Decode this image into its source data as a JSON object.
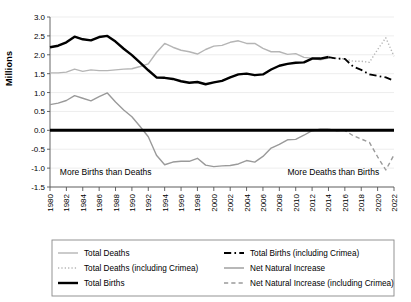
{
  "chart_data": {
    "type": "line",
    "title": "",
    "xlabel": "",
    "ylabel": "Millions",
    "xlim": [
      1980,
      2022
    ],
    "ylim": [
      -1.5,
      3.0
    ],
    "ytick_step": 0.5,
    "xtick_step": 2,
    "grid": true,
    "legend_position": "bottom",
    "yticks": [
      "3.0",
      "2.5",
      "2.0",
      "1.5",
      "1.0",
      "0.5",
      "0.0",
      "-0.5",
      "-1.0",
      "-1.5"
    ],
    "xticks": [
      "1980",
      "1982",
      "1984",
      "1986",
      "1988",
      "1990",
      "1992",
      "1994",
      "1996",
      "1998",
      "2000",
      "2002",
      "2004",
      "2006",
      "2008",
      "2010",
      "2012",
      "2014",
      "2016",
      "2018",
      "2020",
      "2022"
    ],
    "annotations": [
      {
        "text": "More Births than Deaths",
        "x": 1981.2,
        "y": -1.18,
        "align": "left"
      },
      {
        "text": "More Deaths than Births",
        "x": 2009.0,
        "y": -1.18,
        "align": "left"
      }
    ],
    "zero_line": 0.0,
    "series": [
      {
        "name": "Total Deaths",
        "color": "#b5b5b5",
        "style": "solid",
        "width": 1.4,
        "x": [
          1980,
          1981,
          1982,
          1983,
          1984,
          1985,
          1986,
          1987,
          1988,
          1989,
          1990,
          1991,
          1992,
          1993,
          1994,
          1995,
          1996,
          1997,
          1998,
          1999,
          2000,
          2001,
          2002,
          2003,
          2004,
          2005,
          2006,
          2007,
          2008,
          2009,
          2010,
          2011,
          2012,
          2013,
          2014
        ],
        "values": [
          1.52,
          1.52,
          1.54,
          1.62,
          1.56,
          1.6,
          1.58,
          1.58,
          1.6,
          1.62,
          1.63,
          1.69,
          1.76,
          2.06,
          2.3,
          2.2,
          2.12,
          2.08,
          2.02,
          2.14,
          2.23,
          2.25,
          2.33,
          2.37,
          2.3,
          2.3,
          2.17,
          2.08,
          2.08,
          2.01,
          2.03,
          1.93,
          1.91,
          1.87,
          1.91
        ]
      },
      {
        "name": "Total Deaths (including Crimea)",
        "color": "#b5b5b5",
        "style": "dotted",
        "width": 1.4,
        "x": [
          2014,
          2015,
          2016,
          2017,
          2018,
          2019,
          2020,
          2021,
          2022
        ],
        "values": [
          1.91,
          1.91,
          1.89,
          1.83,
          1.83,
          1.8,
          2.14,
          2.45,
          1.96
        ]
      },
      {
        "name": "Total Births",
        "color": "#000000",
        "style": "solid",
        "width": 2.4,
        "x": [
          1980,
          1981,
          1982,
          1983,
          1984,
          1985,
          1986,
          1987,
          1988,
          1989,
          1990,
          1991,
          1992,
          1993,
          1994,
          1995,
          1996,
          1997,
          1998,
          1999,
          2000,
          2001,
          2002,
          2003,
          2004,
          2005,
          2006,
          2007,
          2008,
          2009,
          2010,
          2011,
          2012,
          2013,
          2014
        ],
        "values": [
          2.2,
          2.24,
          2.33,
          2.48,
          2.41,
          2.38,
          2.47,
          2.5,
          2.35,
          2.16,
          1.99,
          1.79,
          1.59,
          1.4,
          1.39,
          1.36,
          1.3,
          1.26,
          1.28,
          1.22,
          1.27,
          1.31,
          1.4,
          1.48,
          1.5,
          1.46,
          1.48,
          1.61,
          1.71,
          1.76,
          1.79,
          1.8,
          1.9,
          1.9,
          1.94
        ]
      },
      {
        "name": "Total Births (including Crimea)",
        "color": "#000000",
        "style": "dashdot",
        "width": 1.8,
        "x": [
          2014,
          2015,
          2016,
          2017,
          2018,
          2019,
          2020,
          2021,
          2022
        ],
        "values": [
          1.94,
          1.9,
          1.89,
          1.69,
          1.6,
          1.48,
          1.44,
          1.4,
          1.31
        ]
      },
      {
        "name": "Net Natural Increase",
        "color": "#9a9a9a",
        "style": "solid",
        "width": 1.4,
        "x": [
          1980,
          1981,
          1982,
          1983,
          1984,
          1985,
          1986,
          1987,
          1988,
          1989,
          1990,
          1991,
          1992,
          1993,
          1994,
          1995,
          1996,
          1997,
          1998,
          1999,
          2000,
          2001,
          2002,
          2003,
          2004,
          2005,
          2006,
          2007,
          2008,
          2009,
          2010,
          2011,
          2012,
          2013,
          2014
        ],
        "values": [
          0.68,
          0.72,
          0.79,
          0.92,
          0.85,
          0.78,
          0.89,
          0.99,
          0.75,
          0.54,
          0.36,
          0.1,
          -0.17,
          -0.66,
          -0.91,
          -0.84,
          -0.82,
          -0.82,
          -0.74,
          -0.92,
          -0.96,
          -0.94,
          -0.93,
          -0.89,
          -0.8,
          -0.84,
          -0.69,
          -0.47,
          -0.37,
          -0.25,
          -0.24,
          -0.13,
          -0.01,
          0.03,
          0.03
        ]
      },
      {
        "name": "Net Natural Increase (including Crimea)",
        "color": "#9a9a9a",
        "style": "dashed",
        "width": 1.4,
        "x": [
          2014,
          2015,
          2016,
          2017,
          2018,
          2019,
          2020,
          2021,
          2022
        ],
        "values": [
          0.03,
          -0.01,
          -0.0,
          -0.14,
          -0.23,
          -0.32,
          -0.7,
          -1.05,
          -0.65
        ]
      }
    ],
    "legend": [
      {
        "label": "Total Deaths",
        "color": "#b5b5b5",
        "style": "solid",
        "width": 1.4,
        "column": 0,
        "row": 0
      },
      {
        "label": "Total Deaths (including Crimea)",
        "color": "#b5b5b5",
        "style": "dotted",
        "width": 1.4,
        "column": 0,
        "row": 1
      },
      {
        "label": "Total Births",
        "color": "#000000",
        "style": "solid",
        "width": 2.4,
        "column": 0,
        "row": 2
      },
      {
        "label": "Total Births (including Crimea)",
        "color": "#000000",
        "style": "dashdot",
        "width": 1.8,
        "column": 1,
        "row": 0
      },
      {
        "label": "Net Natural Increase",
        "color": "#9a9a9a",
        "style": "solid",
        "width": 1.4,
        "column": 1,
        "row": 1
      },
      {
        "label": "Net Natural Increase (including Crimea)",
        "color": "#9a9a9a",
        "style": "dashed",
        "width": 1.4,
        "column": 1,
        "row": 2
      }
    ]
  }
}
